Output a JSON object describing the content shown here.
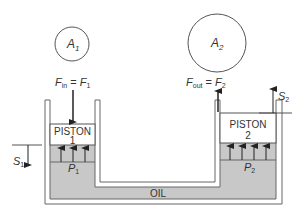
{
  "diagram": {
    "type": "hydraulic-press",
    "colors": {
      "oil": "#c8c8c8",
      "line": "#555555",
      "text": "#333333",
      "background": "#ffffff"
    },
    "area_1": {
      "symbol": "A",
      "subscript": "1"
    },
    "area_2": {
      "symbol": "A",
      "subscript": "2"
    },
    "force_in": {
      "lhs": "F",
      "lhs_sub": "in",
      "eq": " = ",
      "rhs": "F",
      "rhs_sub": "1"
    },
    "force_out": {
      "lhs": "F",
      "lhs_sub": "out",
      "eq": " = ",
      "rhs": "F",
      "rhs_sub": "2"
    },
    "piston_1": {
      "line1": "PISTON",
      "line2": "1"
    },
    "piston_2": {
      "line1": "PISTON",
      "line2": "2"
    },
    "pressure_1": {
      "symbol": "P",
      "subscript": "1"
    },
    "pressure_2": {
      "symbol": "P",
      "subscript": "2"
    },
    "displacement_1": {
      "symbol": "S",
      "subscript": "1"
    },
    "displacement_2": {
      "symbol": "S",
      "subscript": "2"
    },
    "fluid_label": "OIL"
  }
}
